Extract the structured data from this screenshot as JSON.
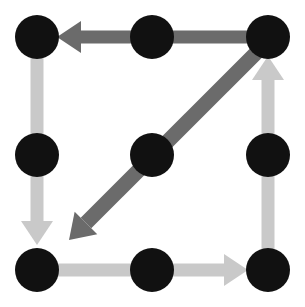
{
  "figure": {
    "width": 305,
    "height": 307,
    "background_color": "#ffffff"
  },
  "palette": {
    "node_fill": "#111111",
    "arrow_dark": "#6b6b6b",
    "arrow_light": "#c9c9c9",
    "background": "#ffffff"
  },
  "chart_data": {
    "type": "scatter",
    "xlabel": "",
    "ylabel": "",
    "xlim": [
      0,
      305
    ],
    "ylim": [
      0,
      307
    ],
    "grid": false,
    "legend": false,
    "nodes": [
      {
        "id": "n1",
        "label": "top-left",
        "x": 37,
        "y": 37,
        "radius": 22,
        "color": "#111111"
      },
      {
        "id": "n2",
        "label": "top-center",
        "x": 152,
        "y": 37,
        "radius": 22,
        "color": "#111111"
      },
      {
        "id": "n3",
        "label": "top-right",
        "x": 268,
        "y": 37,
        "radius": 22,
        "color": "#111111"
      },
      {
        "id": "n4",
        "label": "middle-left",
        "x": 37,
        "y": 155,
        "radius": 22,
        "color": "#111111"
      },
      {
        "id": "n5",
        "label": "middle-center",
        "x": 152,
        "y": 155,
        "radius": 22,
        "color": "#111111"
      },
      {
        "id": "n6",
        "label": "middle-right",
        "x": 268,
        "y": 155,
        "radius": 22,
        "color": "#111111"
      },
      {
        "id": "n7",
        "label": "bottom-left",
        "x": 37,
        "y": 270,
        "radius": 22,
        "color": "#111111"
      },
      {
        "id": "n8",
        "label": "bottom-center",
        "x": 152,
        "y": 270,
        "radius": 22,
        "color": "#111111"
      },
      {
        "id": "n9",
        "label": "bottom-right",
        "x": 268,
        "y": 270,
        "radius": 22,
        "color": "#111111"
      }
    ],
    "edges": [
      {
        "id": "e-top",
        "label": "top edge, rightward to leftward",
        "from": "top-right",
        "to": "top-left",
        "direction": "left",
        "color": "#6b6b6b",
        "shaft_width": 13,
        "start_x": 270,
        "start_y": 37,
        "end_x": 57,
        "end_y": 37
      },
      {
        "id": "e-left",
        "label": "left edge, downward",
        "from": "top-left",
        "to": "bottom-left",
        "direction": "down",
        "color": "#c9c9c9",
        "shaft_width": 13,
        "start_x": 37,
        "start_y": 52,
        "end_x": 37,
        "end_y": 245
      },
      {
        "id": "e-bottom",
        "label": "bottom edge, rightward",
        "from": "bottom-left",
        "to": "bottom-right",
        "direction": "right",
        "color": "#c9c9c9",
        "shaft_width": 13,
        "start_x": 52,
        "start_y": 270,
        "end_x": 248,
        "end_y": 270
      },
      {
        "id": "e-right",
        "label": "right edge, upward",
        "from": "bottom-right",
        "to": "top-right",
        "direction": "up",
        "color": "#c9c9c9",
        "shaft_width": 13,
        "start_x": 268,
        "start_y": 255,
        "end_x": 268,
        "end_y": 56
      },
      {
        "id": "e-diagonal",
        "label": "diagonal, top-right through center to lower-left",
        "from": "top-right",
        "to": "lower-left-interior",
        "direction": "down-left",
        "color": "#6b6b6b",
        "shaft_width": 15,
        "start_x": 262,
        "start_y": 47,
        "end_x": 69,
        "end_y": 240
      }
    ],
    "counts": {
      "nodes": 9,
      "edges": 5,
      "dark_edges": 2,
      "light_edges": 3
    }
  }
}
